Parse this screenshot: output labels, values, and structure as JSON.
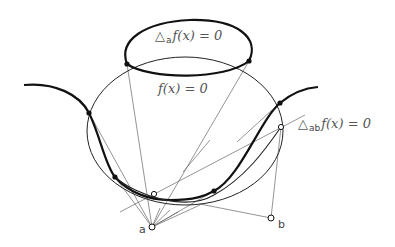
{
  "diagram": {
    "labels": {
      "delta_a": {
        "symbol": "△",
        "sub": "a",
        "expr": "f(x) = 0"
      },
      "f_zero": {
        "expr": "f(x) = 0"
      },
      "delta_ab": {
        "symbol": "△",
        "sub": "ab",
        "expr": "f(x) = 0"
      }
    },
    "points": {
      "a": "a",
      "b": "b"
    },
    "colors": {
      "stroke": "#111111",
      "thin": "#444444",
      "text": "#555555"
    }
  }
}
